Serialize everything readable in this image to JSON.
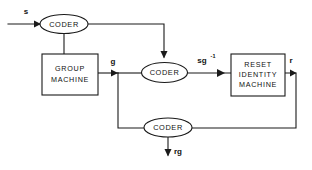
{
  "diagram": {
    "stroke_color": "#1a1a1a",
    "background_color": "#ffffff",
    "blocks": [
      {
        "id": "group-machine",
        "line1": "GROUP",
        "line2": "MACHINE",
        "line3": ""
      },
      {
        "id": "reset-identity-machine",
        "line1": "RESET",
        "line2": "IDENTITY",
        "line3": "MACHINE"
      }
    ],
    "coders": [
      {
        "id": "coder-input",
        "label": "CODER"
      },
      {
        "id": "coder-middle",
        "label": "CODER"
      },
      {
        "id": "coder-feedback",
        "label": "CODER"
      }
    ],
    "signals": [
      {
        "id": "input-signal",
        "label": "s"
      },
      {
        "id": "group-output-signal",
        "label": "g"
      },
      {
        "id": "coded-signal-base",
        "label": "sg"
      },
      {
        "id": "coded-signal-exponent",
        "label": "-1"
      },
      {
        "id": "reset-output-signal",
        "label": "r"
      },
      {
        "id": "feedback-output-signal",
        "label": "rg"
      }
    ]
  }
}
